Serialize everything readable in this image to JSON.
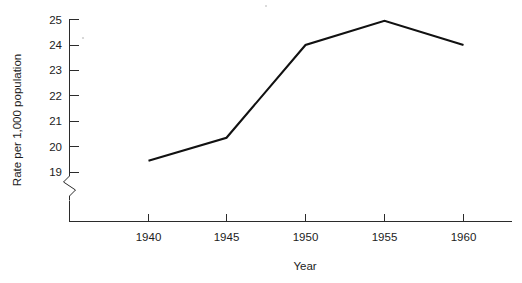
{
  "chart_data": {
    "type": "line",
    "title": "",
    "subtitle": "",
    "xlabel": "Year",
    "ylabel": "Rate per 1,000 population",
    "x": [
      1940,
      1945,
      1950,
      1955,
      1960
    ],
    "categories": [
      "1940",
      "1945",
      "1950",
      "1955",
      "1960"
    ],
    "values": [
      19.45,
      20.35,
      24.0,
      24.95,
      24.0
    ],
    "series": [
      {
        "name": "",
        "values": [
          19.45,
          20.35,
          24.0,
          24.95,
          24.0
        ]
      }
    ],
    "xlim": [
      1937.5,
      1962.5
    ],
    "ylim": [
      19,
      25
    ],
    "y_axis_break": true,
    "y_axis_break_note": "zigzag break below 19",
    "yticks": [
      19,
      20,
      21,
      22,
      23,
      24,
      25
    ],
    "ytick_labels": [
      "19",
      "20",
      "21",
      "22",
      "23",
      "24",
      "25"
    ],
    "xticks": [
      1940,
      1945,
      1950,
      1955,
      1960
    ],
    "xtick_labels": [
      "1940",
      "1945",
      "1950",
      "1955",
      "1960"
    ],
    "grid": false,
    "legend": false,
    "legend_position": "none",
    "line_color": "#111111",
    "axis_color": "#2b2b2b",
    "background_color": "#ffffff"
  },
  "axes": {
    "y_title": "Rate per 1,000 population",
    "x_title": "Year",
    "y_ticks": [
      {
        "label": "25",
        "value": 25
      },
      {
        "label": "24",
        "value": 24
      },
      {
        "label": "23",
        "value": 23
      },
      {
        "label": "22",
        "value": 22
      },
      {
        "label": "21",
        "value": 21
      },
      {
        "label": "20",
        "value": 20
      },
      {
        "label": "19",
        "value": 19
      }
    ],
    "x_ticks": [
      {
        "label": "1940",
        "value": 1940
      },
      {
        "label": "1945",
        "value": 1945
      },
      {
        "label": "1950",
        "value": 1950
      },
      {
        "label": "1955",
        "value": 1955
      },
      {
        "label": "1960",
        "value": 1960
      }
    ]
  }
}
